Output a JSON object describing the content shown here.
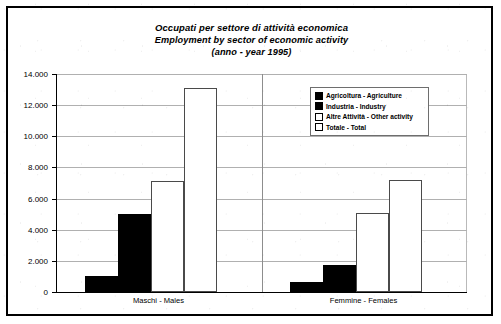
{
  "figure": {
    "frame_color": "#000000",
    "background": "#ffffff"
  },
  "title": {
    "line1": "Occupati per settore di attività economica",
    "line2": "Employment by sector of economic activity",
    "line3": "(anno - year 1995)"
  },
  "legend": {
    "position": "top-right-inside",
    "items": [
      {
        "label": "Agricoltura - Agriculture",
        "style": "solid",
        "color": "#000000"
      },
      {
        "label": "Industria - Industry",
        "style": "solid",
        "color": "#000000"
      },
      {
        "label": "Altre Attività - Other activity",
        "style": "hollow",
        "color": "#ffffff"
      },
      {
        "label": "Totale - Total",
        "style": "hollow",
        "color": "#ffffff"
      }
    ]
  },
  "axes": {
    "y_ticks": [
      "0",
      "2.000",
      "4.000",
      "6.000",
      "8.000",
      "10.000",
      "12.000",
      "14.000"
    ],
    "x_categories": [
      "Maschi - Males",
      "Femmine - Females"
    ]
  },
  "chart_data": {
    "type": "bar",
    "xlabel": "",
    "ylabel": "",
    "ylim": [
      0,
      14000
    ],
    "ytick_step": 2000,
    "grid": true,
    "legend_position": "upper right",
    "categories": [
      "Maschi - Males",
      "Femmine - Females"
    ],
    "series": [
      {
        "name": "Agricoltura - Agriculture",
        "style": "solid",
        "values": [
          1050,
          670
        ]
      },
      {
        "name": "Industria - Industry",
        "style": "solid",
        "values": [
          5000,
          1730
        ]
      },
      {
        "name": "Altre Attività - Other activity",
        "style": "hollow",
        "values": [
          7100,
          5070
        ]
      },
      {
        "name": "Totale - Total",
        "style": "hollow",
        "values": [
          13100,
          7200
        ]
      }
    ]
  }
}
